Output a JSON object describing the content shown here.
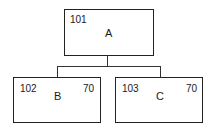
{
  "diagram": {
    "type": "hierarchy",
    "nodes": [
      {
        "id": "101",
        "label": "A",
        "value": null,
        "parent": null
      },
      {
        "id": "102",
        "label": "B",
        "value": "70",
        "parent": "101"
      },
      {
        "id": "103",
        "label": "C",
        "value": "70",
        "parent": "101"
      }
    ],
    "colors": {
      "line": "#222222",
      "background": "#ffffff"
    }
  }
}
